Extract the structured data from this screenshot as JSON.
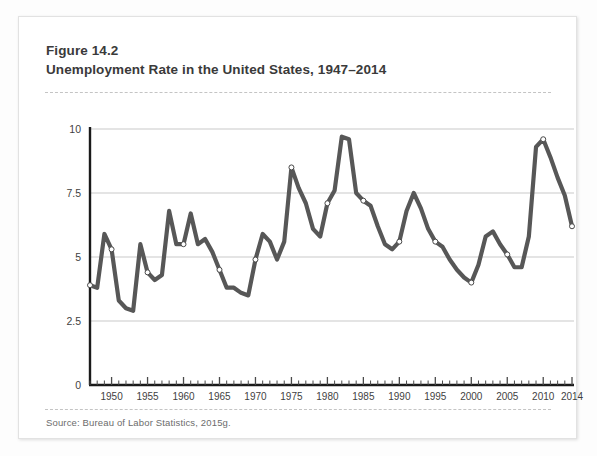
{
  "figure": {
    "number": "Figure 14.2",
    "title": "Unemployment Rate in the United States, 1947–2014",
    "source": "Source: Bureau of Labor Statistics, 2015g."
  },
  "colors": {
    "line": "#575757",
    "marker_fill": "#ffffff",
    "marker_stroke": "#4a4a4a",
    "grid": "#c9c9c9",
    "axis": "#1a1a1a",
    "text": "#3a3a3a",
    "source_text": "#6c6c6c",
    "card_border": "#e2e2e2",
    "background": "#ffffff"
  },
  "chart_data": {
    "type": "line",
    "title": "Unemployment Rate in the United States, 1947–2014",
    "xlabel": "",
    "ylabel": "",
    "xlim": [
      1947,
      2014
    ],
    "ylim": [
      0,
      10
    ],
    "yticks": [
      0,
      2.5,
      5,
      7.5,
      10
    ],
    "ytick_labels": [
      "0",
      "2.5",
      "5",
      "7.5",
      "10"
    ],
    "xticks": [
      1950,
      1955,
      1960,
      1965,
      1970,
      1975,
      1980,
      1985,
      1990,
      1995,
      2000,
      2005,
      2010,
      2014
    ],
    "xtick_labels": [
      "1950",
      "1955",
      "1960",
      "1965",
      "1970",
      "1975",
      "1980",
      "1985",
      "1990",
      "1995",
      "2000",
      "2005",
      "2010",
      "2014"
    ],
    "minor_xticks_every": 1,
    "grid": "horizontal",
    "legend": "none",
    "marker_years": [
      1947,
      1950,
      1955,
      1960,
      1965,
      1970,
      1975,
      1980,
      1985,
      1990,
      1995,
      2000,
      2005,
      2010,
      2014
    ],
    "x": [
      1947,
      1948,
      1949,
      1950,
      1951,
      1952,
      1953,
      1954,
      1955,
      1956,
      1957,
      1958,
      1959,
      1960,
      1961,
      1962,
      1963,
      1964,
      1965,
      1966,
      1967,
      1968,
      1969,
      1970,
      1971,
      1972,
      1973,
      1974,
      1975,
      1976,
      1977,
      1978,
      1979,
      1980,
      1981,
      1982,
      1983,
      1984,
      1985,
      1986,
      1987,
      1988,
      1989,
      1990,
      1991,
      1992,
      1993,
      1994,
      1995,
      1996,
      1997,
      1998,
      1999,
      2000,
      2001,
      2002,
      2003,
      2004,
      2005,
      2006,
      2007,
      2008,
      2009,
      2010,
      2011,
      2012,
      2013,
      2014
    ],
    "values": [
      3.9,
      3.8,
      5.9,
      5.3,
      3.3,
      3.0,
      2.9,
      5.5,
      4.4,
      4.1,
      4.3,
      6.8,
      5.5,
      5.5,
      6.7,
      5.5,
      5.7,
      5.2,
      4.5,
      3.8,
      3.8,
      3.6,
      3.5,
      4.9,
      5.9,
      5.6,
      4.9,
      5.6,
      8.5,
      7.7,
      7.1,
      6.1,
      5.8,
      7.1,
      7.6,
      9.7,
      9.6,
      7.5,
      7.2,
      7.0,
      6.2,
      5.5,
      5.3,
      5.6,
      6.8,
      7.5,
      6.9,
      6.1,
      5.6,
      5.4,
      4.9,
      4.5,
      4.2,
      4.0,
      4.7,
      5.8,
      6.0,
      5.5,
      5.1,
      4.6,
      4.6,
      5.8,
      9.3,
      9.6,
      8.9,
      8.1,
      7.4,
      6.2
    ]
  }
}
